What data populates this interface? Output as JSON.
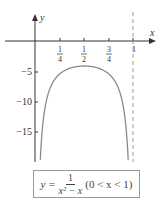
{
  "chart_data": {
    "type": "line",
    "title": "",
    "xlabel": "x",
    "ylabel": "y",
    "function": "y = 1/(x^2 - x)",
    "domain": [
      0,
      1
    ],
    "x_ticks": [
      "1/4",
      "1/2",
      "3/4",
      "1"
    ],
    "x_tick_values": [
      0.25,
      0.5,
      0.75,
      1
    ],
    "y_ticks": [
      "-5",
      "-10",
      "-15"
    ],
    "y_tick_values": [
      -5,
      -10,
      -15
    ],
    "xlim": [
      0,
      1.2
    ],
    "ylim": [
      -20,
      4
    ],
    "series": [
      {
        "name": "y = 1/(x^2 - x)",
        "x": [
          0.055,
          0.1,
          0.15,
          0.2,
          0.25,
          0.3,
          0.4,
          0.5,
          0.6,
          0.7,
          0.75,
          0.8,
          0.85,
          0.9,
          0.945
        ],
        "y": [
          -19.2,
          -11.11,
          -7.84,
          -6.25,
          -5.33,
          -4.76,
          -4.17,
          -4.0,
          -4.17,
          -4.76,
          -5.33,
          -6.25,
          -7.84,
          -11.11,
          -19.2
        ]
      }
    ],
    "asymptotes": [
      {
        "x": 1,
        "style": "dashed"
      }
    ],
    "grid": false,
    "legend": "none",
    "annotation": {
      "lhs": "y =",
      "numerator": "1",
      "denominator": "x² − x",
      "condition": "(0 < x < 1)"
    }
  },
  "labels": {
    "x_axis": "x",
    "y_axis": "y",
    "xt1_num": "1",
    "xt1_den": "4",
    "xt2_num": "1",
    "xt2_den": "2",
    "xt3_num": "3",
    "xt3_den": "4",
    "xt4": "1",
    "yt1": "−5",
    "yt2": "−10",
    "yt3": "−15"
  },
  "formula": {
    "lhs": "y =",
    "numerator": "1",
    "denominator": "x² − x",
    "condition": "(0 < x < 1)"
  },
  "colors": {
    "curve": "#8a8a8a",
    "axis": "#333333",
    "asymptote": "#9a9a9a"
  }
}
